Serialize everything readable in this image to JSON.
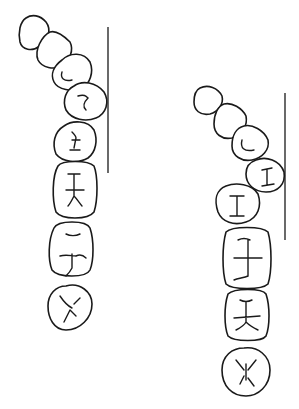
{
  "diagram": {
    "title": "",
    "stroke_color": "#1a1a1a",
    "background": "#ffffff",
    "panels": [
      {
        "name": "left-arch",
        "teeth_count": 8,
        "reference_line": {
          "x": 108,
          "y1": 27,
          "y2": 173
        }
      },
      {
        "name": "right-arch",
        "teeth_count": 8,
        "reference_line": {
          "x": 285,
          "y1": 93,
          "y2": 240
        }
      }
    ]
  }
}
